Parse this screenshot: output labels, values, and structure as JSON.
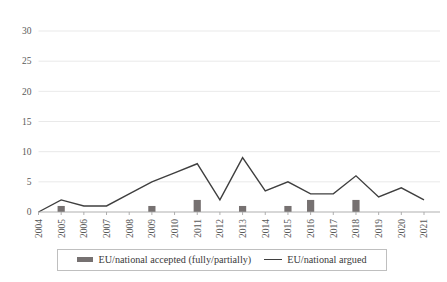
{
  "chart_data": {
    "type": "bar",
    "title": "",
    "xlabel": "",
    "ylabel": "",
    "ylim": [
      0,
      30
    ],
    "yticks": [
      0,
      5,
      10,
      15,
      20,
      25,
      30
    ],
    "grid": true,
    "legend_position": "bottom",
    "categories": [
      "2004",
      "2005",
      "2006",
      "2007",
      "2008",
      "2009",
      "2010",
      "2011",
      "2012",
      "2013",
      "2014",
      "2015",
      "2016",
      "2017",
      "2018",
      "2019",
      "2020",
      "2021"
    ],
    "series": [
      {
        "name": "EU/national accepted (fully/partially)",
        "type": "bar",
        "color": "#767171",
        "values": [
          0,
          1,
          0,
          0,
          0,
          1,
          0,
          2,
          0,
          1,
          0,
          1,
          2,
          0,
          2,
          0,
          0,
          0
        ]
      },
      {
        "name": "EU/national argued",
        "type": "line",
        "color": "#3f3f3f",
        "values": [
          0,
          2,
          1,
          1,
          3,
          5,
          6.5,
          8,
          2,
          9,
          3.5,
          5,
          3,
          3,
          6,
          2.5,
          4,
          2
        ]
      }
    ]
  },
  "legend": {
    "items": [
      {
        "label": "EU/national accepted (fully/partially)",
        "marker": "bar-swatch"
      },
      {
        "label": "EU/national argued",
        "marker": "line-swatch"
      }
    ]
  },
  "axis": {
    "y_tick_labels": [
      "30",
      "25",
      "20",
      "15",
      "10",
      "5",
      "0"
    ],
    "x_tick_labels": [
      "2004",
      "2005",
      "2006",
      "2007",
      "2008",
      "2009",
      "2010",
      "2011",
      "2012",
      "2013",
      "2014",
      "2015",
      "2016",
      "2017",
      "2018",
      "2019",
      "2020",
      "2021"
    ]
  }
}
